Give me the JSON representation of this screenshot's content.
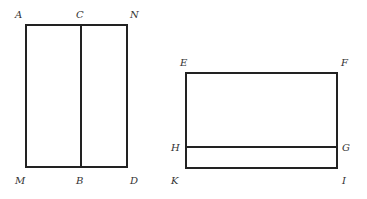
{
  "figure_left": {
    "labels": {
      "A": "A",
      "C": "C",
      "N": "N",
      "M": "M",
      "B": "B",
      "D": "D"
    }
  },
  "figure_right": {
    "labels": {
      "E": "E",
      "F": "F",
      "H": "H",
      "G": "G",
      "K": "K",
      "I": "I"
    }
  },
  "colors": {
    "line": "#222222",
    "label": "#333333",
    "background": "#ffffff"
  }
}
